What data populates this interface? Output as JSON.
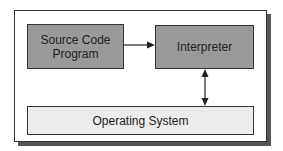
{
  "diagram": {
    "source": {
      "line1": "Source Code",
      "line2": "Program"
    },
    "interpreter": {
      "label": "Interpreter"
    },
    "os": {
      "label": "Operating System"
    },
    "edges": [
      {
        "from": "Source Code Program",
        "to": "Interpreter",
        "type": "one-way"
      },
      {
        "from": "Interpreter",
        "to": "Operating System",
        "type": "bidirectional"
      }
    ],
    "colors": {
      "process_box": "#9a9a9a",
      "os_box": "#ececec",
      "border": "#333333"
    }
  }
}
